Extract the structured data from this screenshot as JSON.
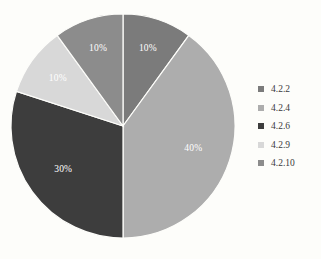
{
  "chart_data": {
    "type": "pie",
    "title": "",
    "categories": [
      "4.2.2",
      "4.2.4",
      "4.2.6",
      "4.2.9",
      "4.2.10"
    ],
    "values": [
      10,
      40,
      30,
      10,
      10
    ],
    "data_labels": [
      "10%",
      "40%",
      "30%",
      "10%",
      "10%"
    ],
    "colors": [
      "#7b7b7b",
      "#adadad",
      "#3d3d3d",
      "#d8d8d8",
      "#8c8c8c"
    ],
    "legend_position": "right",
    "grid": false,
    "start_angle_deg": 0,
    "direction": "clockwise",
    "slices": [
      {
        "label": "4.2.2",
        "value": 10,
        "data_label": "10%",
        "color": "#7b7b7b"
      },
      {
        "label": "4.2.4",
        "value": 40,
        "data_label": "40%",
        "color": "#adadad"
      },
      {
        "label": "4.2.6",
        "value": 30,
        "data_label": "30%",
        "color": "#3d3d3d"
      },
      {
        "label": "4.2.9",
        "value": 10,
        "data_label": "10%",
        "color": "#d8d8d8"
      },
      {
        "label": "4.2.10",
        "value": 10,
        "data_label": "10%",
        "color": "#8c8c8c"
      }
    ]
  },
  "legend": {
    "items": [
      {
        "label": "4.2.2",
        "color": "#7b7b7b"
      },
      {
        "label": "4.2.4",
        "color": "#adadad"
      },
      {
        "label": "4.2.6",
        "color": "#3d3d3d"
      },
      {
        "label": "4.2.9",
        "color": "#d8d8d8"
      },
      {
        "label": "4.2.10",
        "color": "#8c8c8c"
      }
    ]
  },
  "labels": {
    "slice_1": "10%",
    "slice_2": "40%",
    "slice_3": "30%",
    "slice_4": "10%",
    "slice_5": "10%"
  }
}
